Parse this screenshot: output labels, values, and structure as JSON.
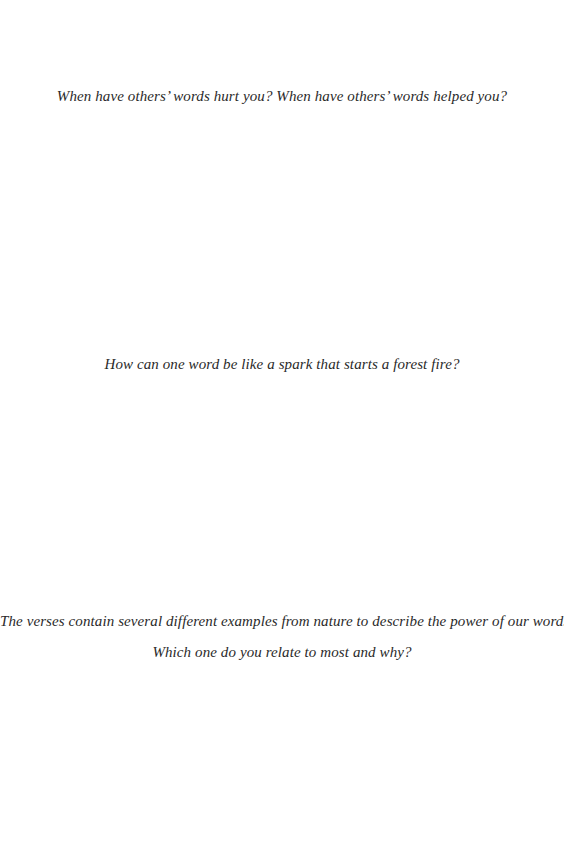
{
  "page": {
    "questions": [
      "When have others’ words hurt you? When have others’ words helped you?",
      "How can one word be like a spark that starts a forest fire?",
      "The verses contain several different examples from nature to describe the power of our words.",
      "Which one do you relate to most and why?"
    ]
  }
}
